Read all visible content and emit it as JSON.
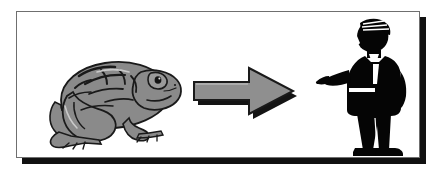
{
  "image": {
    "kind": "clipart-illustration",
    "caption_visible": false,
    "background_color": "#ffffff"
  },
  "frame": {
    "name": "illustration-border",
    "border_color": "#6f6f6f",
    "shadow_color": "#111111",
    "fill_color": "#ffffff"
  },
  "scene": {
    "reading_order": "left-to-right",
    "meaning": "transformation sequence",
    "items": [
      {
        "id": "frog",
        "label": "toad",
        "description": "gray toad / frog sitting in profile facing right",
        "fill_color": "#8a8a8a",
        "outline_color": "#1a1a1a",
        "highlight_color": "#c9c9c9"
      },
      {
        "id": "arrow",
        "label": "right arrow",
        "description": "three dimensional block arrow pointing right",
        "fill_color": "#8f8f8f",
        "outline_color": "#1a1a1a",
        "shadow_color": "#141414"
      },
      {
        "id": "figure",
        "label": "man in formal suit",
        "description": "black silhouette of a standing man in a tuxedo extending one hand",
        "fill_color": "#050505",
        "accent_color": "#ffffff"
      }
    ]
  }
}
